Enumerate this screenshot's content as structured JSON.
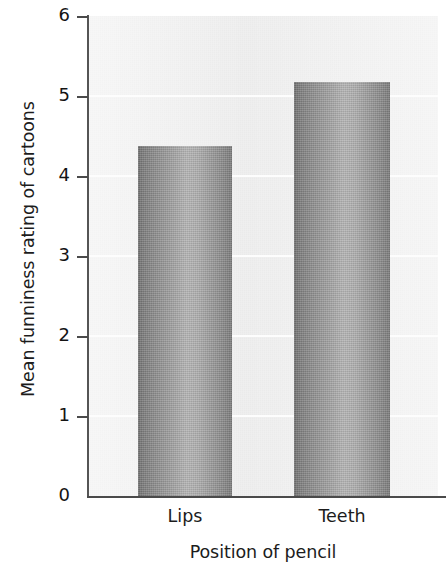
{
  "chart_data": {
    "type": "bar",
    "title": "",
    "categories": [
      "Lips",
      "Teeth"
    ],
    "values": [
      4.38,
      5.18
    ],
    "xlabel": "Position of pencil",
    "ylabel": "Mean funniness rating of cartoons",
    "ylim": [
      0,
      6
    ],
    "yticks": [
      0,
      1,
      2,
      3,
      4,
      5,
      6
    ],
    "ytick_labels": [
      "0",
      "1",
      "2",
      "3",
      "4",
      "5",
      "6"
    ],
    "grid": true,
    "grid_axis": "y",
    "grid_color": "#fdfdfd",
    "legend": null,
    "plot_background": "#eeeeee",
    "bar_color_dark": "#6f6f6f",
    "bar_color_light": "#b4b4b4",
    "axis_color": "#4a4a4a",
    "annotations": []
  },
  "axes": {
    "y_title": "Mean funniness rating of cartoons",
    "x_title": "Position of pencil",
    "y_tick_labels": [
      "6",
      "5",
      "4",
      "3",
      "2",
      "1",
      "0"
    ]
  },
  "bars": [
    {
      "label": "Lips",
      "value": 4.38
    },
    {
      "label": "Teeth",
      "value": 5.18
    }
  ]
}
